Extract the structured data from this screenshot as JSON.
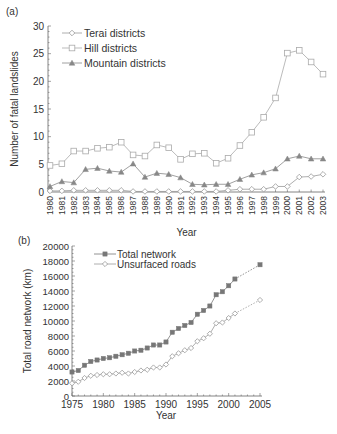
{
  "panels": {
    "a": {
      "label": "(a)"
    },
    "b": {
      "label": "(b)"
    }
  },
  "chart_data": [
    {
      "type": "line",
      "panel": "(a)",
      "title": "",
      "xlabel": "Year",
      "ylabel": "Number of fatal landslides",
      "ylim": [
        0,
        30
      ],
      "yticks": [
        0,
        5,
        10,
        15,
        20,
        25,
        30
      ],
      "legend_position": "upper left",
      "grid": false,
      "x": [
        1980,
        1981,
        1982,
        1983,
        1984,
        1985,
        1986,
        1987,
        1988,
        1989,
        1990,
        1991,
        1992,
        1993,
        1994,
        1995,
        1996,
        1997,
        1998,
        1999,
        2000,
        2001,
        2002,
        2003
      ],
      "series": [
        {
          "name": "Terai districts",
          "marker": "diamond-open",
          "color": "#999999",
          "values": [
            0.2,
            0.2,
            0.3,
            0.3,
            0.3,
            0.3,
            0.3,
            0.1,
            0.1,
            0.1,
            0.1,
            0.1,
            0.1,
            0.1,
            0.1,
            0.3,
            0.5,
            0.5,
            0.5,
            1.0,
            1.0,
            2.7,
            2.8,
            3.2
          ]
        },
        {
          "name": "Hill districts",
          "marker": "square-open",
          "color": "#aaaaaa",
          "values": [
            4.8,
            5.1,
            7.4,
            7.4,
            7.9,
            8.1,
            9.0,
            6.7,
            6.5,
            8.5,
            8.0,
            5.9,
            6.9,
            7.0,
            5.2,
            6.1,
            8.4,
            10.8,
            13.5,
            17.0,
            25.1,
            25.6,
            23.5,
            21.3
          ]
        },
        {
          "name": "Mountain districts",
          "marker": "triangle-filled",
          "color": "#888888",
          "values": [
            1.0,
            1.9,
            1.7,
            4.1,
            4.3,
            3.8,
            3.6,
            5.1,
            2.7,
            3.4,
            3.2,
            2.6,
            1.4,
            1.3,
            1.4,
            1.4,
            2.3,
            3.1,
            3.5,
            4.2,
            6.0,
            6.5,
            6.0,
            6.0
          ]
        }
      ]
    },
    {
      "type": "line",
      "panel": "(b)",
      "title": "",
      "xlabel": "Year",
      "ylabel": "Total road network (km)",
      "ylim": [
        0,
        20000
      ],
      "xlim": [
        1975,
        2005
      ],
      "yticks": [
        0,
        2000,
        4000,
        6000,
        8000,
        10000,
        12000,
        14000,
        16000,
        18000,
        20000
      ],
      "xticks": [
        1975,
        1980,
        1985,
        1990,
        1995,
        2000,
        2005
      ],
      "legend_position": "upper left",
      "grid": false,
      "series": [
        {
          "name": "Total network",
          "marker": "square-filled",
          "color": "#777777",
          "x": [
            1975,
            1976,
            1977,
            1978,
            1979,
            1980,
            1981,
            1982,
            1983,
            1984,
            1985,
            1986,
            1987,
            1988,
            1989,
            1990,
            1991,
            1992,
            1993,
            1994,
            1995,
            1996,
            1997,
            1998,
            1999,
            2000,
            2001,
            2005
          ],
          "values": [
            3200,
            3400,
            4100,
            4600,
            4800,
            5000,
            5100,
            5300,
            5500,
            5700,
            6000,
            6100,
            6400,
            6800,
            6800,
            7200,
            8500,
            9000,
            9400,
            9800,
            10900,
            11400,
            12000,
            13500,
            13900,
            14700,
            15600,
            17500
          ]
        },
        {
          "name": "Unsurfaced roads",
          "marker": "diamond-open",
          "color": "#999999",
          "x": [
            1975,
            1976,
            1977,
            1978,
            1979,
            1980,
            1981,
            1982,
            1983,
            1984,
            1985,
            1986,
            1987,
            1988,
            1989,
            1990,
            1991,
            1992,
            1993,
            1994,
            1995,
            1996,
            1997,
            1998,
            1999,
            2000,
            2001,
            2005
          ],
          "values": [
            1700,
            1900,
            2400,
            2700,
            2800,
            2900,
            2900,
            3000,
            3100,
            3000,
            3200,
            3400,
            3500,
            3800,
            3800,
            4200,
            5300,
            5700,
            6100,
            6400,
            7300,
            7700,
            8300,
            9700,
            9800,
            10400,
            11000,
            12800
          ],
          "dashed_after": 2001
        }
      ]
    }
  ]
}
